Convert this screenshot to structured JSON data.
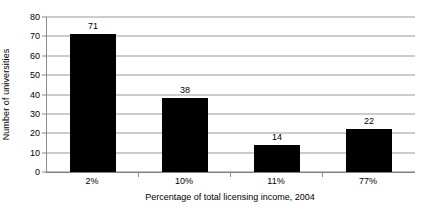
{
  "chart_data": {
    "type": "bar",
    "title": "",
    "subtitle": "",
    "xlabel": "Percentage of total licensing income, 2004",
    "ylabel": "Number of universities",
    "categories": [
      "2%",
      "10%",
      "11%",
      "77%"
    ],
    "values": [
      71,
      38,
      14,
      22
    ],
    "data_labels": [
      "71",
      "38",
      "14",
      "22"
    ],
    "series": [
      {
        "name": "Number of universities",
        "values": [
          71,
          38,
          14,
          22
        ],
        "color": "#000000"
      }
    ],
    "ylim": [
      0,
      80
    ],
    "ytick_step": 10,
    "ytick_labels": [
      "80",
      "70",
      "60",
      "50",
      "40",
      "30",
      "20",
      "10",
      "0"
    ],
    "ytick_values": [
      80,
      70,
      60,
      50,
      40,
      30,
      20,
      10,
      0
    ],
    "grid": "horizontal",
    "gridlines_on": true,
    "legend": "none",
    "legend_position": "none",
    "bar_color": "#000000",
    "grid_color": "#9a9a9a",
    "axis_color": "#808080",
    "background_color": "#ffffff",
    "annotations": []
  }
}
